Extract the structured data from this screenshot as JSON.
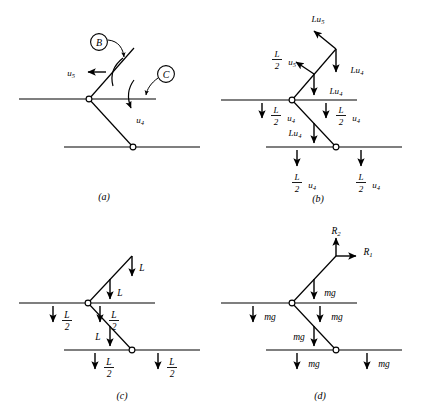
{
  "figure": {
    "stroke_color": "#000000",
    "background_color": "#ffffff",
    "panels": [
      {
        "id": "a",
        "caption": "(a)",
        "description": "Linkage with virtual rotation arrows and labelled joints B and C",
        "labels": {
          "joint_b": "B",
          "joint_c": "C",
          "virtual_disp_upper": "u",
          "virtual_disp_upper_sub": "5",
          "virtual_disp_lower": "u",
          "virtual_disp_lower_sub": "4"
        }
      },
      {
        "id": "b",
        "caption": "(b)",
        "description": "Virtual work force terms acting on each member",
        "forces": [
          {
            "name": "top-tip-diagonal-force",
            "text": "Lu",
            "sub": "5"
          },
          {
            "name": "upper-left-half-force",
            "text_num": "L",
            "text_den": "2",
            "text_tail": "u",
            "tail_sub": "5"
          },
          {
            "name": "upper-right-diagonal-force",
            "text": "Lu",
            "sub": "4"
          },
          {
            "name": "mid-upper-force",
            "text": "Lu",
            "sub": "4"
          },
          {
            "name": "left-beam-half-force",
            "text_num": "L",
            "text_den": "2",
            "text_tail": "u",
            "tail_sub": "4"
          },
          {
            "name": "right-beam-half-force",
            "text_num": "L",
            "text_den": "2",
            "text_tail": "u",
            "tail_sub": "4"
          },
          {
            "name": "lower-diagonal-force",
            "text": "Lu",
            "sub": "4"
          },
          {
            "name": "bottom-left-half-force",
            "text_num": "L",
            "text_den": "2",
            "text_tail": "u",
            "tail_sub": "4"
          },
          {
            "name": "bottom-right-half-force",
            "text_num": "L",
            "text_den": "2",
            "text_tail": "u",
            "tail_sub": "4"
          }
        ]
      },
      {
        "id": "c",
        "caption": "(c)",
        "description": "Distributed load L and half-loads L/2 on the linkage",
        "forces": [
          {
            "name": "top-tip-load",
            "text": "L"
          },
          {
            "name": "upper-diagonal-load",
            "text": "L"
          },
          {
            "name": "left-beam-half-load",
            "text_num": "L",
            "text_den": "2"
          },
          {
            "name": "right-beam-half-load",
            "text_num": "L",
            "text_den": "2"
          },
          {
            "name": "lower-diagonal-load",
            "text": "L"
          },
          {
            "name": "bottom-left-half-load",
            "text_num": "L",
            "text_den": "2"
          },
          {
            "name": "bottom-right-half-load",
            "text_num": "L",
            "text_den": "2"
          }
        ]
      },
      {
        "id": "d",
        "caption": "(d)",
        "description": "Free body diagram with reactions R1, R2 and weights mg",
        "reactions": [
          {
            "name": "reaction-vertical",
            "text": "R",
            "sub": "2"
          },
          {
            "name": "reaction-horizontal",
            "text": "R",
            "sub": "1"
          }
        ],
        "weights": [
          {
            "name": "upper-diagonal-weight",
            "text": "mg"
          },
          {
            "name": "left-beam-weight",
            "text": "mg"
          },
          {
            "name": "right-beam-weight",
            "text": "mg"
          },
          {
            "name": "lower-diagonal-weight",
            "text": "mg"
          },
          {
            "name": "bottom-left-weight",
            "text": "mg"
          },
          {
            "name": "bottom-right-weight",
            "text": "mg"
          }
        ]
      }
    ]
  }
}
